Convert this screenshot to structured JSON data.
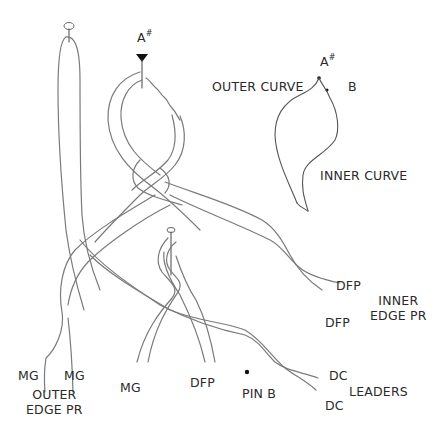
{
  "diagram": {
    "title": "",
    "labels": {
      "pin_a_top": {
        "main": "A",
        "sup": "#"
      },
      "inset_a": {
        "main": "A",
        "sup": "#"
      },
      "outer_curve": "OUTER CURVE",
      "b": "B",
      "inner_curve": "INNER CURVE",
      "dfp_right_upper": "DFP",
      "dfp_right_lower": "DFP",
      "inner_edge_pr": [
        "INNER",
        "EDGE PR"
      ],
      "mg_left_1": "MG",
      "mg_left_2": "MG",
      "outer_edge_pr": [
        "OUTER",
        "EDGE PR"
      ],
      "mg_center": "MG",
      "dfp_center": "DFP",
      "pin_b": "PIN B",
      "dc_upper": "DC",
      "dc_lower": "DC",
      "leaders": "LEADERS"
    },
    "markers": {
      "pin_a": "triangle-pin",
      "top_loop_pin": "ellipse-pin",
      "center_loop_pin": "ellipse-pin",
      "pin_b": "dot"
    },
    "colors": {
      "stroke": "#7a7a7a",
      "text": "#2a2a2a",
      "background": "#ffffff"
    }
  }
}
